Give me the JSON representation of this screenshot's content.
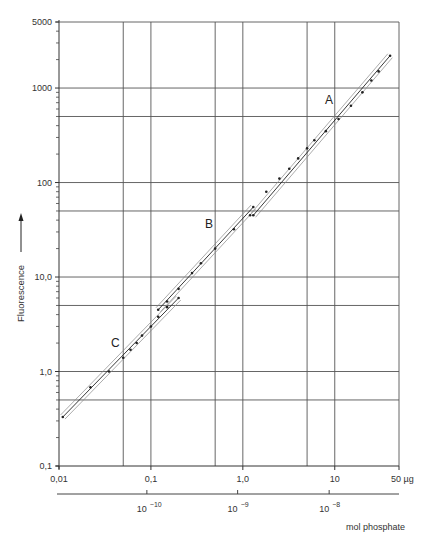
{
  "chart_data": {
    "type": "line",
    "title": "",
    "xlabel": "µg",
    "x2label": "mol phosphate",
    "ylabel": "Fluorescence",
    "xscale": "log",
    "yscale": "log",
    "xlim": [
      0.01,
      50
    ],
    "ylim": [
      0.1,
      5000
    ],
    "grid": true,
    "x_tick_labels": [
      "0,01",
      "0,1",
      "1,0",
      "10",
      "50 µg"
    ],
    "x_tick_values": [
      0.01,
      0.1,
      1,
      10,
      50
    ],
    "x_grid_values": [
      0.05,
      0.1,
      0.5,
      1,
      5,
      10,
      50
    ],
    "y_tick_labels": [
      "0,1",
      "1,0",
      "10,0",
      "100",
      "1000",
      "5000"
    ],
    "y_tick_values": [
      0.1,
      1,
      10,
      100,
      1000,
      5000
    ],
    "y_grid_values": [
      0.5,
      1,
      5,
      10,
      50,
      100,
      500,
      1000,
      5000
    ],
    "x2_tick_labels": [
      "10",
      "10",
      "10"
    ],
    "x2_tick_exponents": [
      "-10",
      "-9",
      "-8"
    ],
    "x2_tick_x_ug": [
      0.105,
      1.02,
      10.1
    ],
    "series": [
      {
        "name": "C",
        "x": [
          0.011,
          0.022,
          0.035,
          0.05,
          0.06,
          0.07,
          0.08,
          0.1,
          0.12,
          0.15,
          0.2
        ],
        "y": [
          0.33,
          0.68,
          1.0,
          1.4,
          1.7,
          2.0,
          2.4,
          3.0,
          3.8,
          4.8,
          6.0
        ]
      },
      {
        "name": "B",
        "x": [
          0.12,
          0.15,
          0.2,
          0.28,
          0.35,
          0.5,
          0.8,
          1.2,
          1.3
        ],
        "y": [
          4.5,
          5.5,
          7.5,
          11,
          14,
          20,
          32,
          45,
          55
        ]
      },
      {
        "name": "A",
        "x": [
          1.3,
          1.8,
          2.5,
          3.2,
          4.0,
          5.0,
          6.0,
          8.0,
          11,
          15,
          20,
          25,
          30,
          40
        ],
        "y": [
          45,
          80,
          110,
          140,
          180,
          230,
          280,
          350,
          470,
          650,
          900,
          1200,
          1500,
          2200
        ]
      }
    ],
    "annotations": [
      "A",
      "B",
      "C"
    ]
  },
  "labels": {
    "y_axis": "Fluorescence",
    "x_unit": "µg",
    "x2_axis": "mol phosphate",
    "curve_a": "A",
    "curve_b": "B",
    "curve_c": "C"
  }
}
